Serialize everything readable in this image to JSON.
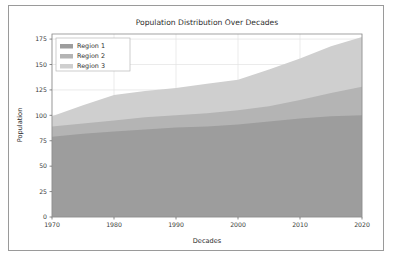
{
  "figure": {
    "border_color": "#9a9a9a",
    "background": "#ffffff"
  },
  "chart_data": {
    "type": "area",
    "stacked": true,
    "title": "Population Distribution Over Decades",
    "xlabel": "Decades",
    "ylabel": "Population",
    "x": [
      1970,
      1975,
      1980,
      1985,
      1990,
      1995,
      2000,
      2005,
      2010,
      2015,
      2020
    ],
    "xlim": [
      1970,
      2020
    ],
    "ylim": [
      0,
      180
    ],
    "xticks": [
      1970,
      1980,
      1990,
      2000,
      2010,
      2020
    ],
    "xtick_labels": [
      "1970",
      "1980",
      "1990",
      "2000",
      "2010",
      "2020"
    ],
    "yticks": [
      0,
      25,
      50,
      75,
      100,
      125,
      150,
      175
    ],
    "ytick_labels": [
      "0",
      "25",
      "50",
      "75",
      "100",
      "125",
      "150",
      "175"
    ],
    "grid": true,
    "legend_position": "upper left",
    "series": [
      {
        "name": "Region 1",
        "color": "#9d9d9d",
        "values": [
          79,
          82,
          84,
          86,
          88,
          89,
          91,
          94,
          97,
          99,
          100
        ]
      },
      {
        "name": "Region 2",
        "color": "#b4b4b4",
        "values": [
          10,
          10,
          11,
          12,
          12,
          13,
          14,
          15,
          18,
          23,
          28
        ]
      },
      {
        "name": "Region 3",
        "color": "#cfcfcf",
        "values": [
          10,
          18,
          25,
          26,
          27,
          29,
          30,
          36,
          41,
          46,
          49
        ]
      }
    ],
    "cumulative": {
      "region1_top": [
        79,
        82,
        84,
        86,
        88,
        89,
        91,
        94,
        97,
        99,
        100
      ],
      "region2_top": [
        89,
        92,
        95,
        98,
        100,
        102,
        105,
        109,
        115,
        122,
        128
      ],
      "region3_top": [
        99,
        110,
        120,
        124,
        127,
        131,
        135,
        145,
        156,
        168,
        177
      ]
    }
  },
  "legend": {
    "entries": [
      {
        "label": "Region 1",
        "swatch": "#9d9d9d"
      },
      {
        "label": "Region 2",
        "swatch": "#b4b4b4"
      },
      {
        "label": "Region 3",
        "swatch": "#cfcfcf"
      }
    ]
  }
}
